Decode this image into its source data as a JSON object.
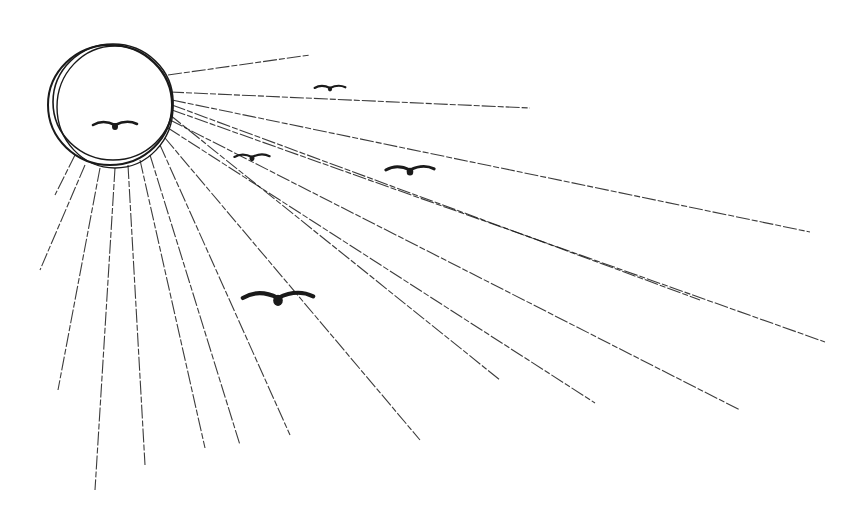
{
  "scene": {
    "description": "Pen sketch of a sun with radiating rays and five flying birds",
    "colors": {
      "ink": "#1a1a1a",
      "background": "#ffffff"
    },
    "sun": {
      "cx": 110,
      "cy": 105,
      "r": 62
    },
    "rays": [
      [
        168,
        75,
        310,
        55
      ],
      [
        170,
        92,
        530,
        108
      ],
      [
        172,
        100,
        810,
        232
      ],
      [
        172,
        110,
        825,
        342
      ],
      [
        170,
        120,
        740,
        410
      ],
      [
        168,
        128,
        595,
        403
      ],
      [
        165,
        138,
        420,
        440
      ],
      [
        160,
        145,
        290,
        435
      ],
      [
        150,
        155,
        240,
        445
      ],
      [
        140,
        160,
        205,
        448
      ],
      [
        128,
        165,
        145,
        465
      ],
      [
        115,
        168,
        95,
        490
      ],
      [
        100,
        168,
        58,
        390
      ],
      [
        85,
        165,
        40,
        270
      ],
      [
        75,
        155,
        55,
        195
      ],
      [
        172,
        105,
        700,
        300
      ],
      [
        170,
        115,
        500,
        380
      ]
    ],
    "birds": [
      {
        "x": 115,
        "y": 125,
        "s": 1.0
      },
      {
        "x": 330,
        "y": 88,
        "s": 0.7
      },
      {
        "x": 252,
        "y": 157,
        "s": 0.8
      },
      {
        "x": 410,
        "y": 170,
        "s": 1.1
      },
      {
        "x": 278,
        "y": 298,
        "s": 1.6
      }
    ]
  }
}
